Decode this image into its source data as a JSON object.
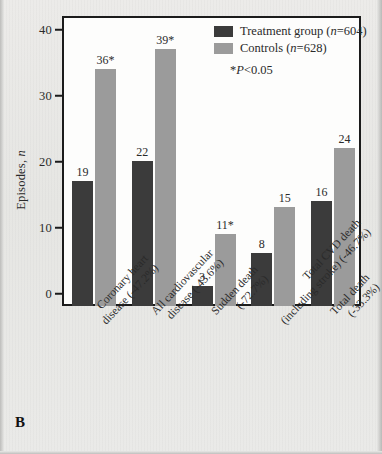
{
  "panel": {
    "letter": "B"
  },
  "legend": {
    "items": [
      {
        "label_text": "Treatment group (",
        "label_italic": "n",
        "label_tail": "=604)",
        "swatch": "treatment",
        "color": "#3b3b3b",
        "name": "Treatment group (n=604)"
      },
      {
        "label_text": "Controls (",
        "label_italic": "n",
        "label_tail": "=628)",
        "swatch": "control",
        "color": "#9b9b9b",
        "name": "Controls (n=628)"
      }
    ],
    "note_prefix": "*",
    "note_italic": "P",
    "note_tail": "<0.05",
    "note_full": "*P<0.05"
  },
  "axes": {
    "y_title_text": "Episodes, ",
    "y_title_italic": "n",
    "y_ticks": [
      0,
      10,
      20,
      30,
      40
    ],
    "y_min": 0,
    "y_max": 44
  },
  "chart_data": {
    "type": "bar",
    "title": "",
    "xlabel": "",
    "ylabel": "Episodes, n",
    "ylim": [
      0,
      44
    ],
    "grid": false,
    "legend_position": "top-right",
    "categories": [
      "Coronary heart disease (-47.2%)",
      "All cardiovascular disease (-43.6%)",
      "Sudden death (-72.7%)",
      "Total CVD death (including stroke) (-46.7%)",
      "Total death (-33.3%)"
    ],
    "category_lines": [
      [
        "Coronary heart",
        "disease (-47.2%)"
      ],
      [
        "All cardiovascular",
        "disease (-43.6%)"
      ],
      [
        "Sudden death",
        "(-72.7%)"
      ],
      [
        "Total CVD death",
        "(including stroke) (-46.7%)"
      ],
      [
        "Total death",
        "(-33.3%)"
      ]
    ],
    "series": [
      {
        "name": "Treatment group (n=604)",
        "color": "#3b3b3b",
        "values": [
          19,
          22,
          3,
          8,
          16
        ],
        "labels": [
          "19",
          "22",
          "3",
          "8",
          "16"
        ],
        "significant": [
          false,
          false,
          false,
          false,
          false
        ]
      },
      {
        "name": "Controls (n=628)",
        "color": "#9b9b9b",
        "values": [
          36,
          39,
          11,
          15,
          24
        ],
        "labels": [
          "36*",
          "39*",
          "11*",
          "15",
          "24"
        ],
        "significant": [
          true,
          true,
          true,
          false,
          false
        ]
      }
    ],
    "annotations": [
      "*P<0.05"
    ],
    "n_treatment": 604,
    "n_controls": 628
  }
}
